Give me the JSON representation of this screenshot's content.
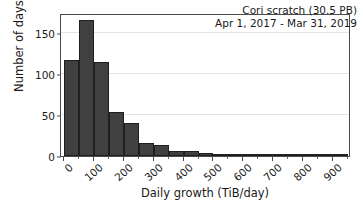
{
  "chart_data": {
    "type": "bar",
    "title": "",
    "subtitle": "",
    "xlabel": "Daily growth (TiB/day)",
    "ylabel": "Number of days",
    "xlim": [
      -10,
      960
    ],
    "ylim": [
      0,
      175
    ],
    "grid": "horizontal",
    "legend_position": "none",
    "bin_width": 50,
    "bin_edges": [
      0,
      50,
      100,
      150,
      200,
      250,
      300,
      350,
      400,
      450,
      500,
      550,
      600,
      650,
      700,
      750,
      800,
      850,
      900,
      950
    ],
    "categories": [
      "0-50",
      "50-100",
      "100-150",
      "150-200",
      "200-250",
      "250-300",
      "300-350",
      "350-400",
      "400-450",
      "450-500",
      "500-550",
      "550-600",
      "600-650",
      "650-700",
      "700-750",
      "750-800",
      "800-850",
      "850-900",
      "900-950"
    ],
    "values": [
      117,
      167,
      115,
      54,
      40,
      16,
      14,
      6,
      6,
      4,
      3,
      1,
      0,
      3,
      0,
      1,
      0,
      1,
      0
    ],
    "bar_color": "#404040",
    "bar_edge_color": "#1f1f1f",
    "xticks": [
      0,
      100,
      200,
      300,
      400,
      500,
      600,
      700,
      800,
      900
    ],
    "xticklabels": [
      "0",
      "100",
      "200",
      "300",
      "400",
      "500",
      "600",
      "700",
      "800",
      "900"
    ],
    "xtick_minor": [
      50,
      150,
      250,
      350,
      450,
      550,
      650,
      750,
      850,
      950
    ],
    "yticks": [
      0,
      50,
      100,
      150
    ],
    "yticklabels": [
      "0",
      "50",
      "100",
      "150"
    ],
    "annotation_lines": [
      "Cori scratch (30.5 PB)",
      "Apr 1, 2017 - Mar 31, 2019"
    ]
  }
}
